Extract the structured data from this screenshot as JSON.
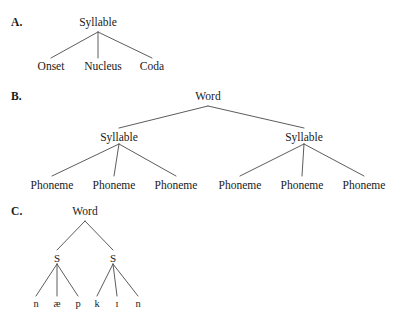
{
  "figure": {
    "background_color": "#ffffff",
    "line_color": "#4a4a4a",
    "text_color": "#1a1a1a",
    "width": 404,
    "height": 322
  },
  "panels": {
    "a": {
      "letter": "A.",
      "root": "Syllable",
      "leaves": [
        "Onset",
        "Nucleus",
        "Coda"
      ]
    },
    "b": {
      "letter": "B.",
      "root": "Word",
      "level2": [
        "Syllable",
        "Syllable"
      ],
      "leaves": [
        "Phoneme",
        "Phoneme",
        "Phoneme",
        "Phoneme",
        "Phoneme",
        "Phoneme"
      ]
    },
    "c": {
      "letter": "C.",
      "root": "Word",
      "level2": [
        "S",
        "S"
      ],
      "leaves": [
        "n",
        "æ",
        "p",
        "k",
        "ɪ",
        "n"
      ]
    }
  }
}
